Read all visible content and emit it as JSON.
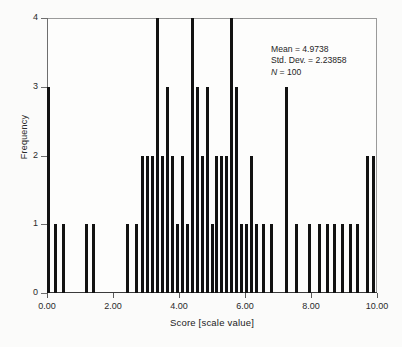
{
  "chart_data": {
    "type": "bar",
    "title": "",
    "subtitle": "",
    "xlabel": "Score [scale value]",
    "ylabel": "Frequency",
    "xlim": [
      0,
      10
    ],
    "ylim": [
      0,
      4
    ],
    "grid": false,
    "legend": null,
    "bar_width_units": 0.085,
    "x_ticks": [
      "0.00",
      "2.00",
      "4.00",
      "6.00",
      "8.00",
      "10.00"
    ],
    "x_tick_values": [
      0,
      2,
      4,
      6,
      8,
      10
    ],
    "y_ticks": [
      "0",
      "1",
      "2",
      "3",
      "4"
    ],
    "y_tick_values": [
      0,
      1,
      2,
      3,
      4
    ],
    "x": [
      0.05,
      0.25,
      0.5,
      1.2,
      1.4,
      2.45,
      2.7,
      2.9,
      3.05,
      3.2,
      3.35,
      3.5,
      3.65,
      3.8,
      3.95,
      4.1,
      4.25,
      4.4,
      4.55,
      4.7,
      4.85,
      5.0,
      5.15,
      5.3,
      5.45,
      5.6,
      5.75,
      5.9,
      6.05,
      6.2,
      6.35,
      6.55,
      6.8,
      7.25,
      7.55,
      7.95,
      8.25,
      8.5,
      8.7,
      8.95,
      9.2,
      9.4,
      9.7,
      9.9
    ],
    "values": [
      3,
      1,
      1,
      1,
      1,
      1,
      1,
      2,
      2,
      2,
      4,
      2,
      3,
      2,
      1,
      2,
      1,
      4,
      3,
      2,
      3,
      1,
      2,
      2,
      2,
      4,
      3,
      1,
      1,
      2,
      1,
      1,
      1,
      3,
      1,
      1,
      1,
      1,
      1,
      1,
      1,
      1,
      2,
      2
    ],
    "annotations": {
      "mean_label": "Mean = ",
      "mean_value": "4.9738",
      "sd_label": "Std. Dev. = ",
      "sd_value": "2.23858",
      "n_label": "N",
      "n_value": " = 100"
    },
    "colors": {
      "bar": "#121212",
      "frame": "#9a9a9a",
      "axis": "#3a3a3a",
      "text": "#1f1f1f",
      "background": "#fdfdfc"
    }
  }
}
